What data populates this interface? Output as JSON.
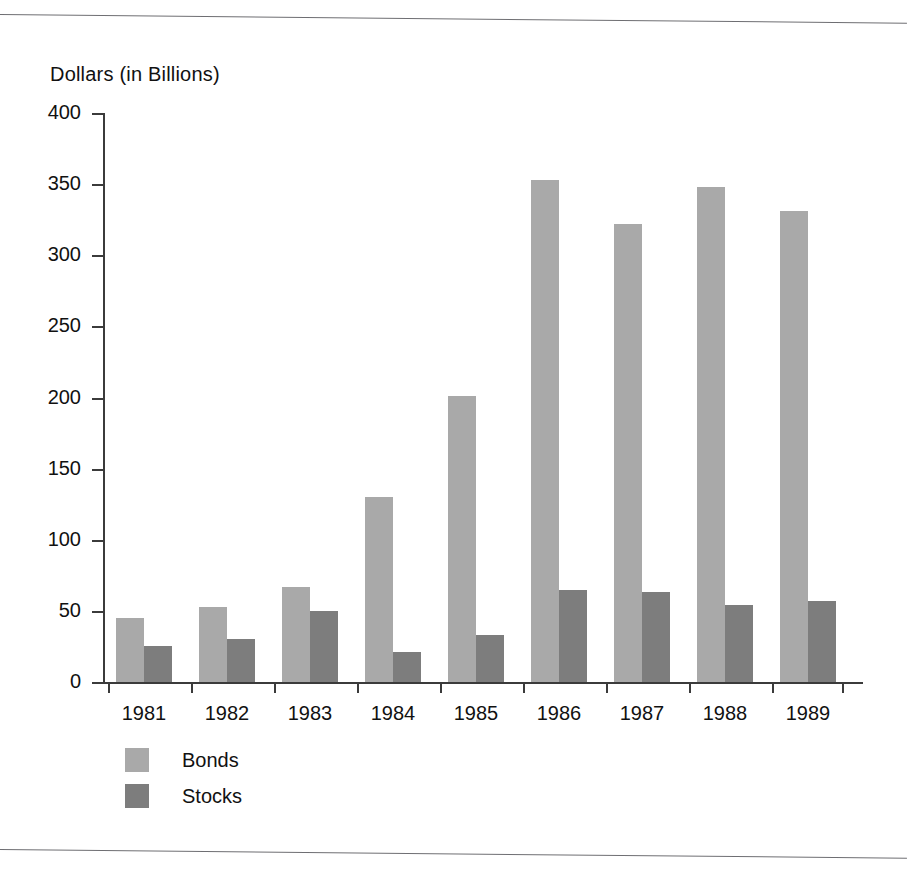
{
  "chart_data": {
    "type": "bar",
    "title": "",
    "subtitle": "",
    "xlabel": "",
    "ylabel": "Dollars (in Billions)",
    "categories": [
      "1981",
      "1982",
      "1983",
      "1984",
      "1985",
      "1986",
      "1987",
      "1988",
      "1989"
    ],
    "series": [
      {
        "name": "Bonds",
        "color": "#a9a9a9",
        "values": [
          45,
          53,
          67,
          130,
          201,
          353,
          322,
          348,
          331
        ]
      },
      {
        "name": "Stocks",
        "color": "#7d7d7d",
        "values": [
          25,
          30,
          50,
          21,
          33,
          65,
          63,
          54,
          57
        ]
      }
    ],
    "ylim": [
      0,
      400
    ],
    "yticks": [
      0,
      50,
      100,
      150,
      200,
      250,
      300,
      350,
      400
    ],
    "ytick_labels": [
      "0",
      "50",
      "100",
      "150",
      "200",
      "250",
      "300",
      "350",
      "400"
    ],
    "grid": false,
    "legend_position": "bottom-left",
    "bar_mode": "grouped"
  },
  "legend": {
    "items": [
      {
        "label": "Bonds",
        "color": "#a9a9a9"
      },
      {
        "label": "Stocks",
        "color": "#7d7d7d"
      }
    ]
  },
  "colors": {
    "bonds": "#a9a9a9",
    "stocks": "#7d7d7d",
    "axis": "#3b3b3b",
    "rule": "#6e6e72",
    "text": "#111111",
    "background": "#ffffff"
  }
}
